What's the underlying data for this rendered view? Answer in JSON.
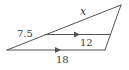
{
  "diagram": {
    "type": "triangle-with-parallel-segment",
    "colors": {
      "line": "#555555",
      "label": "#3a3a3a",
      "background": "#ffffff"
    },
    "vertices": {
      "left": [
        7,
        50
      ],
      "top": [
        121,
        5
      ],
      "bottom_right": [
        105,
        50
      ]
    },
    "parallel_segment": {
      "from": [
        45,
        34
      ],
      "to": [
        111,
        34
      ]
    },
    "labels": {
      "x": "x",
      "upper_left_side": "7.5",
      "parallel_segment_length": "12",
      "base_length": "18"
    },
    "arrows": {
      "middle_line": "parallel-marker",
      "base_line": "parallel-marker"
    }
  }
}
